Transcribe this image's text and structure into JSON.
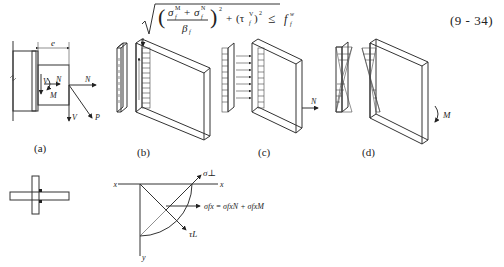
{
  "equation": {
    "lhs_description": "sqrt( ((sigma_f^M + sigma_f^N) / beta_f)^2 + (tau_f^V)^2 ) <= f_f^w",
    "sigma_M": "σ",
    "sup_M": "M",
    "sub_f": "f",
    "plus": "+",
    "sup_N": "N",
    "beta": "β",
    "exp2": "2",
    "tau_term": "(τ",
    "sup_V": "V",
    "tau_close": ")",
    "leq": "≤",
    "f": "f",
    "sup_w": "w",
    "number": "(9 - 34)"
  },
  "figure": {
    "panel_a": {
      "caption": "(a)",
      "labels": {
        "e": "e",
        "V_inner": "V",
        "N_inner": "N",
        "M_inner": "M",
        "N_outer": "N",
        "V_outer": "V",
        "P": "P"
      }
    },
    "panel_b": {
      "caption": "(b)",
      "labels": {
        "V": "V"
      }
    },
    "panel_c": {
      "caption": "(c)",
      "labels": {
        "N": "N"
      }
    },
    "panel_d": {
      "caption": "(d)",
      "labels": {
        "M": "M"
      }
    },
    "stress_diagram": {
      "labels": {
        "x_left": "x",
        "x_right": "x",
        "y": "y",
        "sigma_perp": "σ⊥",
        "tau_L": "τL",
        "sigma_fx": "σfx = σfxN + σfxM"
      }
    }
  }
}
